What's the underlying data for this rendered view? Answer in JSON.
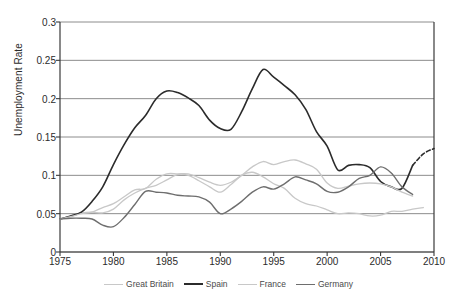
{
  "chart_data": {
    "type": "line",
    "title": "",
    "xlabel": "",
    "ylabel": "Unemployment Rate",
    "xlim": [
      1975,
      2010
    ],
    "ylim": [
      0,
      0.3
    ],
    "grid": true,
    "grid_axis": "y",
    "legend_position": "bottom",
    "xticks": [
      1975,
      1980,
      1985,
      1990,
      1995,
      2000,
      2005,
      2010
    ],
    "xtick_labels": [
      "1975",
      "1980",
      "1985",
      "1990",
      "1995",
      "2000",
      "2005",
      "2010"
    ],
    "yticks": [
      0,
      0.05,
      0.1,
      0.15,
      0.2,
      0.25,
      0.3
    ],
    "ytick_labels": [
      "0",
      "0.05",
      "0.1",
      "0.15",
      "0.2",
      "0.25",
      "0.3"
    ],
    "series": [
      {
        "name": "Great Britain",
        "color": "#c8c8c8",
        "width": 1.3,
        "x": [
          1975,
          1976,
          1977,
          1978,
          1979,
          1980,
          1981,
          1982,
          1983,
          1984,
          1985,
          1986,
          1987,
          1988,
          1989,
          1990,
          1991,
          1992,
          1993,
          1994,
          1995,
          1996,
          1997,
          1998,
          1999,
          2000,
          2001,
          2002,
          2003,
          2004,
          2005,
          2006,
          2007,
          2008,
          2009
        ],
        "values": [
          0.043,
          0.047,
          0.051,
          0.052,
          0.051,
          0.056,
          0.068,
          0.077,
          0.083,
          0.087,
          0.094,
          0.101,
          0.1,
          0.093,
          0.085,
          0.078,
          0.088,
          0.1,
          0.104,
          0.098,
          0.089,
          0.083,
          0.07,
          0.063,
          0.06,
          0.055,
          0.05,
          0.051,
          0.05,
          0.047,
          0.048,
          0.053,
          0.053,
          0.056,
          0.058
        ]
      },
      {
        "name": "Spain",
        "color": "#2b2b2b",
        "width": 1.6,
        "x": [
          1975,
          1976,
          1977,
          1978,
          1979,
          1980,
          1981,
          1982,
          1983,
          1984,
          1985,
          1986,
          1987,
          1988,
          1989,
          1990,
          1991,
          1992,
          1993,
          1994,
          1995,
          1996,
          1997,
          1998,
          1999,
          2000,
          2001,
          2002,
          2003,
          2004,
          2005,
          2006,
          2007,
          2008
        ],
        "values": [
          0.043,
          0.047,
          0.052,
          0.066,
          0.085,
          0.114,
          0.14,
          0.162,
          0.178,
          0.2,
          0.21,
          0.208,
          0.201,
          0.191,
          0.172,
          0.161,
          0.16,
          0.183,
          0.213,
          0.238,
          0.228,
          0.217,
          0.205,
          0.186,
          0.157,
          0.138,
          0.107,
          0.113,
          0.114,
          0.11,
          0.092,
          0.085,
          0.083,
          0.113
        ],
        "note": "solid portion"
      },
      {
        "name": "Spain projection",
        "color": "#2b2b2b",
        "width": 1.6,
        "style": "dashed",
        "x": [
          2008,
          2009,
          2010
        ],
        "values": [
          0.113,
          0.128,
          0.135
        ]
      },
      {
        "name": "France",
        "color": "#c8c8c8",
        "width": 1.3,
        "x": [
          1975,
          1976,
          1977,
          1978,
          1979,
          1980,
          1981,
          1982,
          1983,
          1984,
          1985,
          1986,
          1987,
          1988,
          1989,
          1990,
          1991,
          1992,
          1993,
          1994,
          1995,
          1996,
          1997,
          1998,
          1999,
          2000,
          2001,
          2002,
          2003,
          2004,
          2005,
          2006,
          2007,
          2008
        ],
        "values": [
          0.043,
          0.046,
          0.05,
          0.052,
          0.058,
          0.063,
          0.072,
          0.081,
          0.083,
          0.095,
          0.102,
          0.102,
          0.102,
          0.097,
          0.091,
          0.087,
          0.091,
          0.1,
          0.111,
          0.118,
          0.114,
          0.118,
          0.12,
          0.115,
          0.108,
          0.09,
          0.083,
          0.086,
          0.089,
          0.09,
          0.089,
          0.085,
          0.078,
          0.073
        ]
      },
      {
        "name": "Germany",
        "color": "#6e6e6e",
        "width": 1.4,
        "x": [
          1975,
          1976,
          1977,
          1978,
          1979,
          1980,
          1981,
          1982,
          1983,
          1984,
          1985,
          1986,
          1987,
          1988,
          1989,
          1990,
          1991,
          1992,
          1993,
          1994,
          1995,
          1996,
          1997,
          1998,
          1999,
          2000,
          2001,
          2002,
          2003,
          2004,
          2005,
          2006,
          2007,
          2008
        ],
        "values": [
          0.043,
          0.044,
          0.044,
          0.043,
          0.035,
          0.033,
          0.045,
          0.062,
          0.079,
          0.078,
          0.077,
          0.074,
          0.073,
          0.072,
          0.065,
          0.05,
          0.056,
          0.066,
          0.078,
          0.085,
          0.082,
          0.089,
          0.098,
          0.094,
          0.089,
          0.079,
          0.078,
          0.085,
          0.096,
          0.1,
          0.111,
          0.103,
          0.085,
          0.075
        ]
      }
    ]
  },
  "axes": {
    "ylabel": "Unemployment Rate"
  },
  "legend": {
    "items": [
      {
        "label": "Great Britain",
        "color": "#c8c8c8",
        "thickness": "1.4px"
      },
      {
        "label": "Spain",
        "color": "#2b2b2b",
        "thickness": "2px"
      },
      {
        "label": "France",
        "color": "#c8c8c8",
        "thickness": "1.4px"
      },
      {
        "label": "Germany",
        "color": "#6e6e6e",
        "thickness": "1.6px"
      }
    ]
  },
  "colors": {
    "axis": "#3a3a3a",
    "grid": "#8c8c8c",
    "background": "#ffffff",
    "text": "#2b2b2b"
  }
}
